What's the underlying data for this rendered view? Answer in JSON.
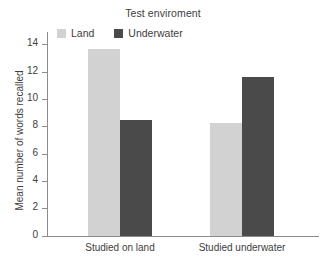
{
  "chart_data": {
    "type": "bar",
    "title": "Test enviroment",
    "xlabel": "",
    "ylabel": "Mean number of words recalled",
    "categories": [
      "Studied on land",
      "Studied underwater"
    ],
    "series": [
      {
        "name": "Land",
        "color": "#d2d2d2",
        "values": [
          13.7,
          8.3
        ]
      },
      {
        "name": "Underwater",
        "color": "#4a4a4a",
        "values": [
          8.5,
          11.6
        ]
      }
    ],
    "ylim": [
      0,
      15
    ],
    "yticks": [
      0,
      2,
      4,
      6,
      8,
      10,
      12,
      14
    ],
    "ytick_labels": [
      "0",
      "2",
      "4",
      "6",
      "8",
      "10",
      "12",
      "14"
    ],
    "grid": false,
    "legend_position": "top-left",
    "legend_entries": [
      "Land",
      "Underwater"
    ]
  },
  "legend": {
    "items": [
      {
        "label": "Land",
        "swatch": "legend-swatch-land"
      },
      {
        "label": "Underwater",
        "swatch": "legend-swatch-underwater"
      }
    ]
  },
  "axis": {
    "y_title": "Mean number of words recalled"
  },
  "colors": {
    "land": "#d2d2d2",
    "underwater": "#4a4a4a",
    "axis": "#8c8c8c",
    "text": "#3d3d3d",
    "background": "#ffffff"
  }
}
